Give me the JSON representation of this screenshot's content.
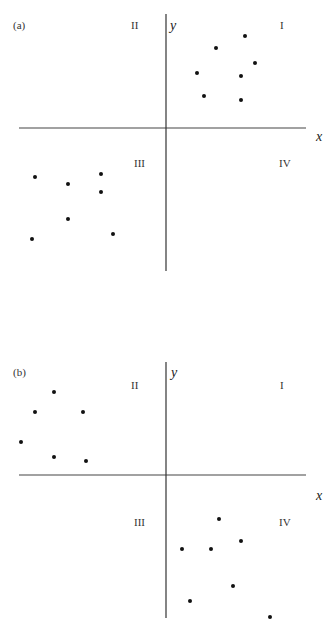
{
  "chart_data": [
    {
      "type": "scatter",
      "panel_label": "(a)",
      "title": "",
      "xlabel": "x",
      "ylabel": "y",
      "quadrant_labels": [
        "I",
        "II",
        "III",
        "IV"
      ],
      "grid": false,
      "legend": null,
      "description": "Points clustered in quadrants I and III (positive association)",
      "series": [
        {
          "name": "quadrant I",
          "points": [
            [
              2.1,
              2.4
            ],
            [
              1.3,
              2.0
            ],
            [
              2.4,
              1.7
            ],
            [
              0.8,
              1.4
            ],
            [
              2.0,
              1.4
            ],
            [
              1.0,
              0.8
            ],
            [
              2.0,
              0.7
            ]
          ]
        },
        {
          "name": "quadrant III",
          "points": [
            [
              -3.5,
              -1.3
            ],
            [
              -2.6,
              -1.5
            ],
            [
              -1.7,
              -1.2
            ],
            [
              -1.7,
              -1.7
            ],
            [
              -2.6,
              -2.5
            ],
            [
              -3.6,
              -3.0
            ],
            [
              -1.4,
              -2.9
            ]
          ]
        }
      ],
      "axes_pixels": {
        "x_axis_y": 128,
        "y_axis_x": 166,
        "x_min": 19,
        "x_max": 306,
        "y_top": 14,
        "y_bottom": 271
      },
      "points_pixels": [
        [
          245,
          36
        ],
        [
          216,
          48
        ],
        [
          255,
          63
        ],
        [
          197,
          73
        ],
        [
          241,
          76
        ],
        [
          204,
          96
        ],
        [
          241,
          100
        ],
        [
          35,
          177
        ],
        [
          68,
          184
        ],
        [
          101,
          174
        ],
        [
          101,
          192
        ],
        [
          68,
          219
        ],
        [
          32,
          239
        ],
        [
          113,
          234
        ]
      ]
    },
    {
      "type": "scatter",
      "panel_label": "(b)",
      "title": "",
      "xlabel": "x",
      "ylabel": "y",
      "quadrant_labels": [
        "I",
        "II",
        "III",
        "IV"
      ],
      "grid": false,
      "legend": null,
      "description": "Points clustered in quadrants II and IV (negative association)",
      "series": [
        {
          "name": "quadrant II",
          "points": [
            [
              -3.0,
              2.3
            ],
            [
              -3.5,
              1.7
            ],
            [
              -2.2,
              1.7
            ],
            [
              -3.9,
              0.9
            ],
            [
              -3.0,
              0.5
            ],
            [
              -2.2,
              0.4
            ]
          ]
        },
        {
          "name": "quadrant IV",
          "points": [
            [
              1.4,
              -1.2
            ],
            [
              2.0,
              -1.8
            ],
            [
              0.4,
              -2.0
            ],
            [
              1.2,
              -2.0
            ],
            [
              1.8,
              -3.0
            ],
            [
              0.6,
              -3.4
            ],
            [
              2.8,
              -3.8
            ]
          ]
        }
      ],
      "axes_pixels": {
        "x_axis_y": 475,
        "y_axis_x": 166,
        "x_min": 19,
        "x_max": 306,
        "y_top": 362,
        "y_bottom": 618
      },
      "points_pixels": [
        [
          54,
          392
        ],
        [
          35,
          412
        ],
        [
          83,
          412
        ],
        [
          21,
          442
        ],
        [
          54,
          457
        ],
        [
          86,
          461
        ],
        [
          219,
          519
        ],
        [
          241,
          541
        ],
        [
          182,
          549
        ],
        [
          211,
          549
        ],
        [
          233,
          586
        ],
        [
          190,
          601
        ],
        [
          270,
          617
        ]
      ]
    }
  ],
  "panels": {
    "a": {
      "label": "(a)",
      "x_label": "x",
      "y_label": "y",
      "q1": "I",
      "q2": "II",
      "q3": "III",
      "q4": "IV"
    },
    "b": {
      "label": "(b)",
      "x_label": "x",
      "y_label": "y",
      "q1": "I",
      "q2": "II",
      "q3": "III",
      "q4": "IV"
    }
  },
  "colors": {
    "axis": "#333333",
    "point": "#111111",
    "text": "#333333"
  }
}
